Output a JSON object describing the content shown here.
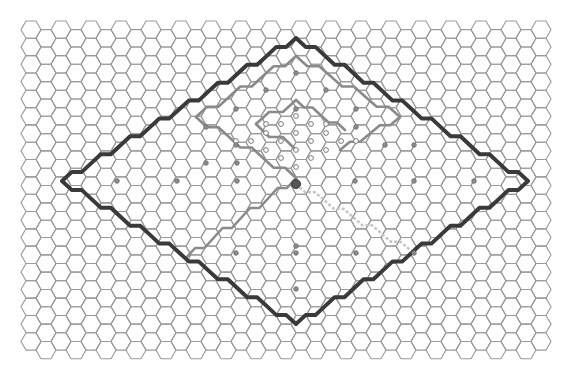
{
  "board": {
    "width": 585,
    "height": 371,
    "hex_radius": 10,
    "origin_x": 21,
    "origin_y": 21,
    "columns": 37,
    "rows": 20,
    "grid_color": "#9a9a9a",
    "background": "#ffffff"
  },
  "paths": {
    "outer_diamond": {
      "color": "#3a3a3a",
      "vertices": {
        "top": [
          296,
          38
        ],
        "left": [
          62,
          181
        ],
        "bottom": [
          296,
          324
        ],
        "right": [
          528,
          181
        ]
      }
    },
    "inner_path_color": "#8a8a8a",
    "dashed_path_color": "#c4c4c4"
  },
  "markers": {
    "dots": [
      [
        117,
        181
      ],
      [
        177,
        181
      ],
      [
        237,
        181
      ],
      [
        355,
        181
      ],
      [
        414,
        181
      ],
      [
        474,
        181
      ],
      [
        236,
        253
      ],
      [
        296,
        253
      ],
      [
        356,
        253
      ],
      [
        296,
        289
      ],
      [
        296,
        73
      ],
      [
        266,
        90
      ],
      [
        326,
        90
      ],
      [
        236,
        109
      ],
      [
        296,
        109
      ],
      [
        356,
        109
      ],
      [
        206,
        127
      ],
      [
        356,
        127
      ],
      [
        236,
        145
      ],
      [
        385,
        145
      ],
      [
        414,
        145
      ],
      [
        206,
        163
      ],
      [
        237,
        163
      ],
      [
        296,
        246
      ],
      [
        414,
        253
      ]
    ],
    "rings": [
      [
        296,
        116
      ],
      [
        281,
        124
      ],
      [
        311,
        124
      ],
      [
        266,
        133
      ],
      [
        296,
        133
      ],
      [
        326,
        133
      ],
      [
        251,
        141
      ],
      [
        281,
        141
      ],
      [
        311,
        141
      ],
      [
        341,
        141
      ],
      [
        266,
        150
      ],
      [
        296,
        150
      ],
      [
        326,
        150
      ],
      [
        281,
        158
      ],
      [
        311,
        158
      ],
      [
        296,
        167
      ],
      [
        236,
        141
      ],
      [
        356,
        141
      ],
      [
        266,
        124
      ],
      [
        326,
        124
      ]
    ],
    "big_dot": [
      296,
      184
    ]
  }
}
